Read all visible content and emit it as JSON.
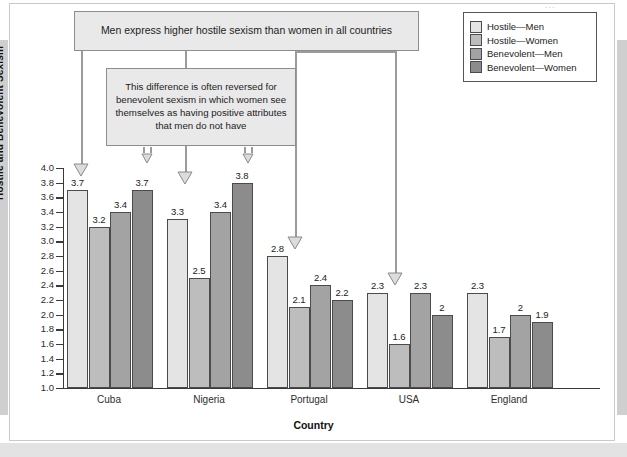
{
  "figure": {
    "scan_mark": "..."
  },
  "callouts": [
    {
      "id": "callout-hostile",
      "text": "Men express higher hostile sexism than women in all countries"
    },
    {
      "id": "callout-benevolent",
      "text": "This difference is often reversed for benevolent sexism in which women see themselves as having positive attributes that men do not have"
    }
  ],
  "legend": {
    "items": [
      {
        "label": "Hostile—Men",
        "color": "#e4e4e4"
      },
      {
        "label": "Hostile—Women",
        "color": "#bdbdbd"
      },
      {
        "label": "Benevolent—Men",
        "color": "#a3a3a3"
      },
      {
        "label": "Benevolent—Women",
        "color": "#8c8c8c"
      }
    ]
  },
  "chart_data": {
    "type": "bar",
    "title": "",
    "xlabel": "Country",
    "ylabel": "Hostile and Benevolent Sexism",
    "ylim": [
      1.0,
      4.0
    ],
    "ytick_step": 0.2,
    "yticks": [
      "4.0",
      "3.8",
      "3.6",
      "3.4",
      "3.2",
      "3.0",
      "2.8",
      "2.6",
      "2.4",
      "2.2",
      "2.0",
      "1.8",
      "1.6",
      "1.4",
      "1.2",
      "1.0"
    ],
    "grid": false,
    "legend_position": "top-right",
    "categories": [
      "Cuba",
      "Nigeria",
      "Portugal",
      "USA",
      "England"
    ],
    "series": [
      {
        "name": "Hostile—Men",
        "color": "#e4e4e4",
        "values": [
          3.7,
          3.3,
          2.8,
          2.3,
          2.3
        ],
        "labels": [
          "3.7",
          "3.3",
          "2.8",
          "2.3",
          "2.3"
        ]
      },
      {
        "name": "Hostile—Women",
        "color": "#bdbdbd",
        "values": [
          3.2,
          2.5,
          2.1,
          1.6,
          1.7
        ],
        "labels": [
          "3.2",
          "2.5",
          "2.1",
          "1.6",
          "1.7"
        ]
      },
      {
        "name": "Benevolent—Men",
        "color": "#a3a3a3",
        "values": [
          3.4,
          3.4,
          2.4,
          2.3,
          2.0
        ],
        "labels": [
          "3.4",
          "3.4",
          "2.4",
          "2.3",
          "2"
        ]
      },
      {
        "name": "Benevolent—Women",
        "color": "#8c8c8c",
        "values": [
          3.7,
          3.8,
          2.2,
          2.0,
          1.9
        ],
        "labels": [
          "3.7",
          "3.8",
          "2.2",
          "2",
          "1.9"
        ]
      }
    ]
  }
}
